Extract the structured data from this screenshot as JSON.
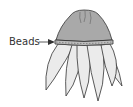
{
  "diagram": {
    "labels": {
      "beads": "Beads"
    },
    "colors": {
      "cap_fill": "#a9a9a9",
      "petal_fill": "#ebebeb",
      "outline": "#333333",
      "band_fill": "#bdbdbd",
      "text": "#333333"
    }
  }
}
